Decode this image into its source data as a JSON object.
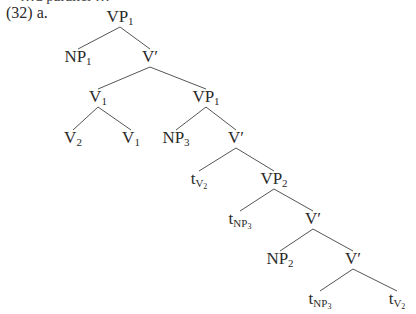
{
  "example": {
    "partial_top_text": "…d parallel …",
    "number": "(32)",
    "letter": "a."
  },
  "tree": {
    "nodes": [
      {
        "id": "n0",
        "cat": "VP",
        "sub": "1",
        "x": 120,
        "y": 8
      },
      {
        "id": "n1",
        "cat": "NP",
        "sub": "1",
        "x": 78,
        "y": 48
      },
      {
        "id": "n2",
        "cat": "V′",
        "sub": "",
        "x": 150,
        "y": 48
      },
      {
        "id": "n3",
        "cat": "V",
        "sub": "1",
        "x": 98,
        "y": 88
      },
      {
        "id": "n4",
        "cat": "VP",
        "sub": "1",
        "x": 206,
        "y": 88
      },
      {
        "id": "n5",
        "cat": "V",
        "sub": "2",
        "x": 73,
        "y": 129
      },
      {
        "id": "n6",
        "cat": "V",
        "sub": "1",
        "x": 131,
        "y": 129
      },
      {
        "id": "n7",
        "cat": "NP",
        "sub": "3",
        "x": 176,
        "y": 129
      },
      {
        "id": "n8",
        "cat": "V′",
        "sub": "",
        "x": 236,
        "y": 129
      },
      {
        "id": "n9",
        "cat": "t",
        "sub": "V",
        "subsub": "2",
        "x": 199,
        "y": 170
      },
      {
        "id": "n10",
        "cat": "VP",
        "sub": "2",
        "x": 274,
        "y": 170
      },
      {
        "id": "n11",
        "cat": "t",
        "sub": "NP",
        "subsub": "3",
        "x": 240,
        "y": 210
      },
      {
        "id": "n12",
        "cat": "V′",
        "sub": "",
        "x": 313,
        "y": 210
      },
      {
        "id": "n13",
        "cat": "NP",
        "sub": "2",
        "x": 280,
        "y": 250
      },
      {
        "id": "n14",
        "cat": "V′",
        "sub": "",
        "x": 353,
        "y": 250
      },
      {
        "id": "n15",
        "cat": "t",
        "sub": "NP",
        "subsub": "3",
        "x": 320,
        "y": 290
      },
      {
        "id": "n16",
        "cat": "t",
        "sub": "V",
        "subsub": "2",
        "x": 397,
        "y": 290
      }
    ],
    "edges": [
      [
        "n0",
        "n1"
      ],
      [
        "n0",
        "n2"
      ],
      [
        "n2",
        "n3"
      ],
      [
        "n2",
        "n4"
      ],
      [
        "n3",
        "n5"
      ],
      [
        "n3",
        "n6"
      ],
      [
        "n4",
        "n7"
      ],
      [
        "n4",
        "n8"
      ],
      [
        "n8",
        "n9"
      ],
      [
        "n8",
        "n10"
      ],
      [
        "n10",
        "n11"
      ],
      [
        "n10",
        "n12"
      ],
      [
        "n12",
        "n13"
      ],
      [
        "n12",
        "n14"
      ],
      [
        "n14",
        "n15"
      ],
      [
        "n14",
        "n16"
      ]
    ]
  },
  "colors": {
    "ink": "#2a2a2a",
    "line": "#555555",
    "background": "#ffffff"
  }
}
